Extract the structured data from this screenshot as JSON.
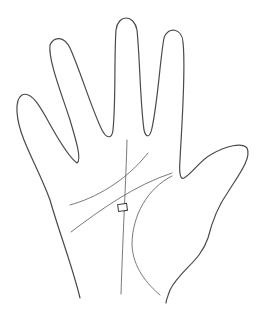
{
  "figure": {
    "background_color": "#ffffff",
    "outline_color": "#4a4a4a",
    "line_color": "#6a6a6a",
    "elements": {
      "hand_outline": "hand-outline",
      "heart_line": "heart-line",
      "head_line": "head-line",
      "life_line": "life-line",
      "fate_line": "fate-line",
      "square_mark": "square-mark"
    }
  }
}
